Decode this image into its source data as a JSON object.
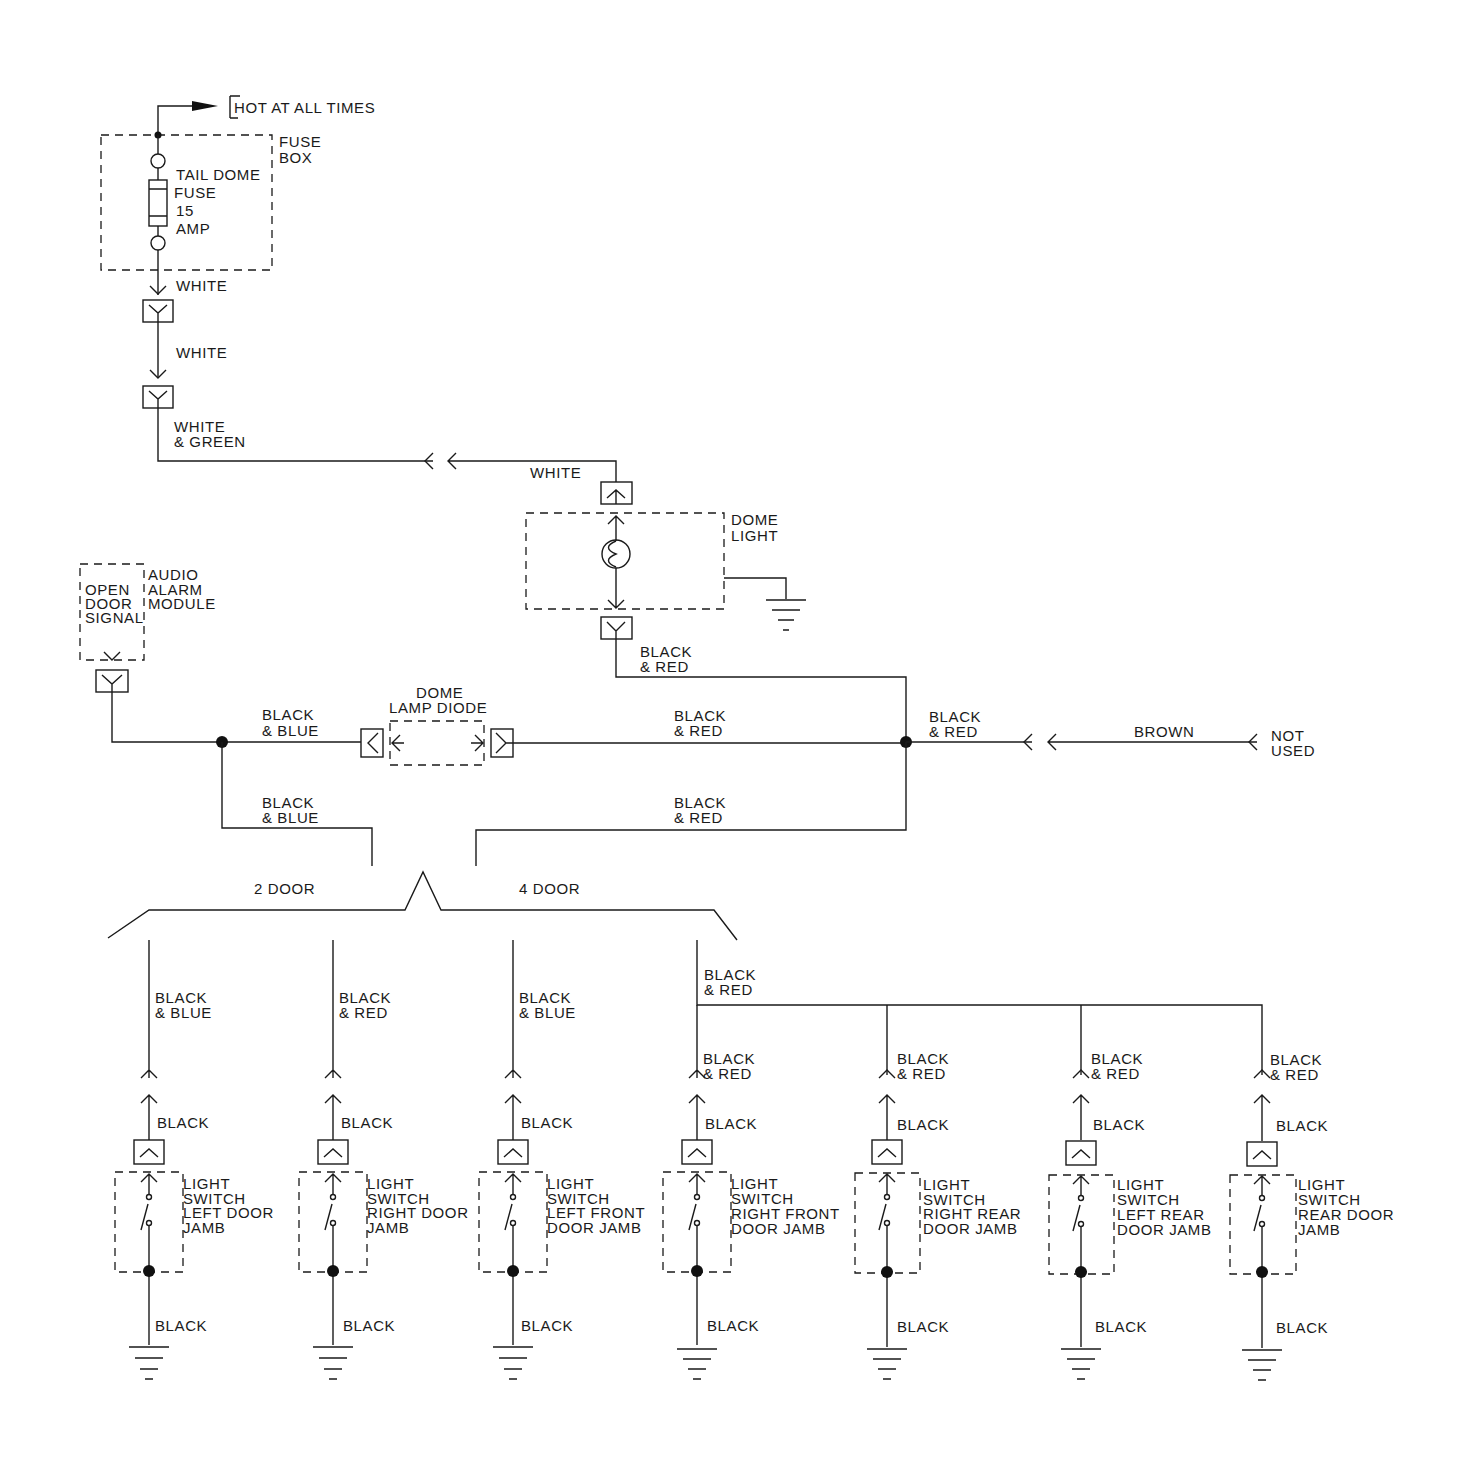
{
  "power": {
    "hot_label": "HOT AT ALL TIMES",
    "fuse_box_label_1": "FUSE",
    "fuse_box_label_2": "BOX",
    "fuse_label_1": "TAIL DOME",
    "fuse_label_2": "FUSE",
    "fuse_label_3": "15",
    "fuse_label_4": "AMP"
  },
  "wires": {
    "white_1": "WHITE",
    "white_2": "WHITE",
    "white_green_1": "WHITE",
    "white_green_2": "& GREEN",
    "white_3": "WHITE",
    "dome_black_red_1": "BLACK",
    "dome_black_red_2": "& RED",
    "bus_black_blue_1": "BLACK",
    "bus_black_blue_2": "& BLUE",
    "bus_black_red_1": "BLACK",
    "bus_black_red_2": "& RED",
    "junction_black_red_1": "BLACK",
    "junction_black_red_2": "& RED",
    "brown": "BROWN",
    "not_used_1": "NOT",
    "not_used_2": "USED",
    "lower_black_blue_1": "BLACK",
    "lower_black_blue_2": "& BLUE",
    "lower_black_red_1": "BLACK",
    "lower_black_red_2": "& RED",
    "feed_black_red_1": "BLACK",
    "feed_black_red_2": "& RED"
  },
  "components": {
    "dome_light_1": "DOME",
    "dome_light_2": "LIGHT",
    "alarm_1": "AUDIO",
    "alarm_2": "ALARM",
    "alarm_3": "MODULE",
    "signal_1": "OPEN",
    "signal_2": "DOOR",
    "signal_3": "SIGNAL",
    "diode_1": "DOME",
    "diode_2": "LAMP DIODE"
  },
  "variants": {
    "two_door": "2 DOOR",
    "four_door": "4 DOOR"
  },
  "switches": [
    {
      "wire_top": [
        "BLACK",
        "& BLUE"
      ],
      "wire_mid": "BLACK",
      "label": [
        "LIGHT",
        "SWITCH",
        "LEFT DOOR",
        "JAMB"
      ],
      "wire_bottom": "BLACK"
    },
    {
      "wire_top": [
        "BLACK",
        "& RED"
      ],
      "wire_mid": "BLACK",
      "label": [
        "LIGHT",
        "SWITCH",
        "RIGHT DOOR",
        "JAMB"
      ],
      "wire_bottom": "BLACK"
    },
    {
      "wire_top": [
        "BLACK",
        "& BLUE"
      ],
      "wire_mid": "BLACK",
      "label": [
        "LIGHT",
        "SWITCH",
        "LEFT FRONT",
        "DOOR JAMB"
      ],
      "wire_bottom": "BLACK"
    },
    {
      "wire_top": [
        "BLACK",
        "& RED"
      ],
      "wire_mid": "BLACK",
      "label": [
        "LIGHT",
        "SWITCH",
        "RIGHT FRONT",
        "DOOR JAMB"
      ],
      "wire_bottom": "BLACK"
    },
    {
      "wire_top": [
        "BLACK",
        "& RED"
      ],
      "wire_mid": "BLACK",
      "label": [
        "LIGHT",
        "SWITCH",
        "RIGHT REAR",
        "DOOR JAMB"
      ],
      "wire_bottom": "BLACK"
    },
    {
      "wire_top": [
        "BLACK",
        "& RED"
      ],
      "wire_mid": "BLACK",
      "label": [
        "LIGHT",
        "SWITCH",
        "LEFT REAR",
        "DOOR JAMB"
      ],
      "wire_bottom": "BLACK"
    },
    {
      "wire_top": [
        "BLACK",
        "& RED"
      ],
      "wire_mid": "BLACK",
      "label": [
        "LIGHT",
        "SWITCH",
        "REAR DOOR",
        "JAMB"
      ],
      "wire_bottom": "BLACK"
    }
  ]
}
